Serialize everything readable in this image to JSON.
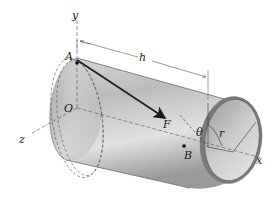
{
  "diagram": {
    "type": "3d-mechanics-figure",
    "labels": {
      "y_axis": "y",
      "x_axis": "x",
      "z_axis": "z",
      "origin": "O",
      "point_a": "A",
      "point_b": "B",
      "force": "F",
      "length": "h",
      "angle": "θ",
      "radius": "r"
    },
    "colors": {
      "cylinder_light": "#e4e4e4",
      "cylinder_mid": "#bdbdbd",
      "cylinder_dark": "#8c8c8c",
      "rim": "#6a6a6a",
      "lines": "#333333",
      "arrow": "#1a1a1a"
    }
  }
}
